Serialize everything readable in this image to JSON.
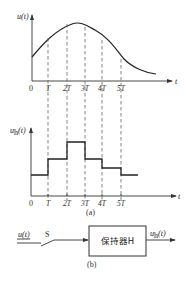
{
  "figure_a": {
    "caption": "(a)",
    "top_plot": {
      "ylabel": "u(t)",
      "xlabel": "t",
      "origin_label": "0",
      "ticks": [
        "T",
        "2T",
        "3T",
        "4T",
        "5T"
      ]
    },
    "bottom_plot": {
      "ylabel": "u_h(t)",
      "ylabel_main": "u",
      "ylabel_sub": "h",
      "ylabel_arg": "(t)",
      "xlabel": "t",
      "origin_label": "0",
      "ticks": [
        "T",
        "2T",
        "3T",
        "4T",
        "5T"
      ]
    }
  },
  "figure_b": {
    "caption": "(b)",
    "input_label": "u(t)",
    "switch_label": "S",
    "block_label": "保持器H",
    "output_label_main": "u",
    "output_label_sub": "h",
    "output_label_arg": "(t)"
  }
}
